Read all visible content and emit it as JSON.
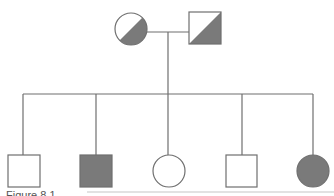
{
  "diagram": {
    "type": "pedigree",
    "colors": {
      "line": "#6f6f6f",
      "affected": "#7a7a7a",
      "unaffected": "#ffffff"
    },
    "parents": [
      {
        "id": "mother",
        "sex": "female",
        "status": "carrier",
        "shape": "circle-half-shaded"
      },
      {
        "id": "father",
        "sex": "male",
        "status": "carrier",
        "shape": "square-half-shaded"
      }
    ],
    "children": [
      {
        "id": "child-1",
        "sex": "male",
        "status": "unaffected"
      },
      {
        "id": "child-2",
        "sex": "male",
        "status": "affected"
      },
      {
        "id": "child-3",
        "sex": "female",
        "status": "unaffected"
      },
      {
        "id": "child-4",
        "sex": "male",
        "status": "unaffected"
      },
      {
        "id": "child-5",
        "sex": "female",
        "status": "affected"
      }
    ]
  },
  "caption": {
    "label": "Figure 8.1"
  }
}
